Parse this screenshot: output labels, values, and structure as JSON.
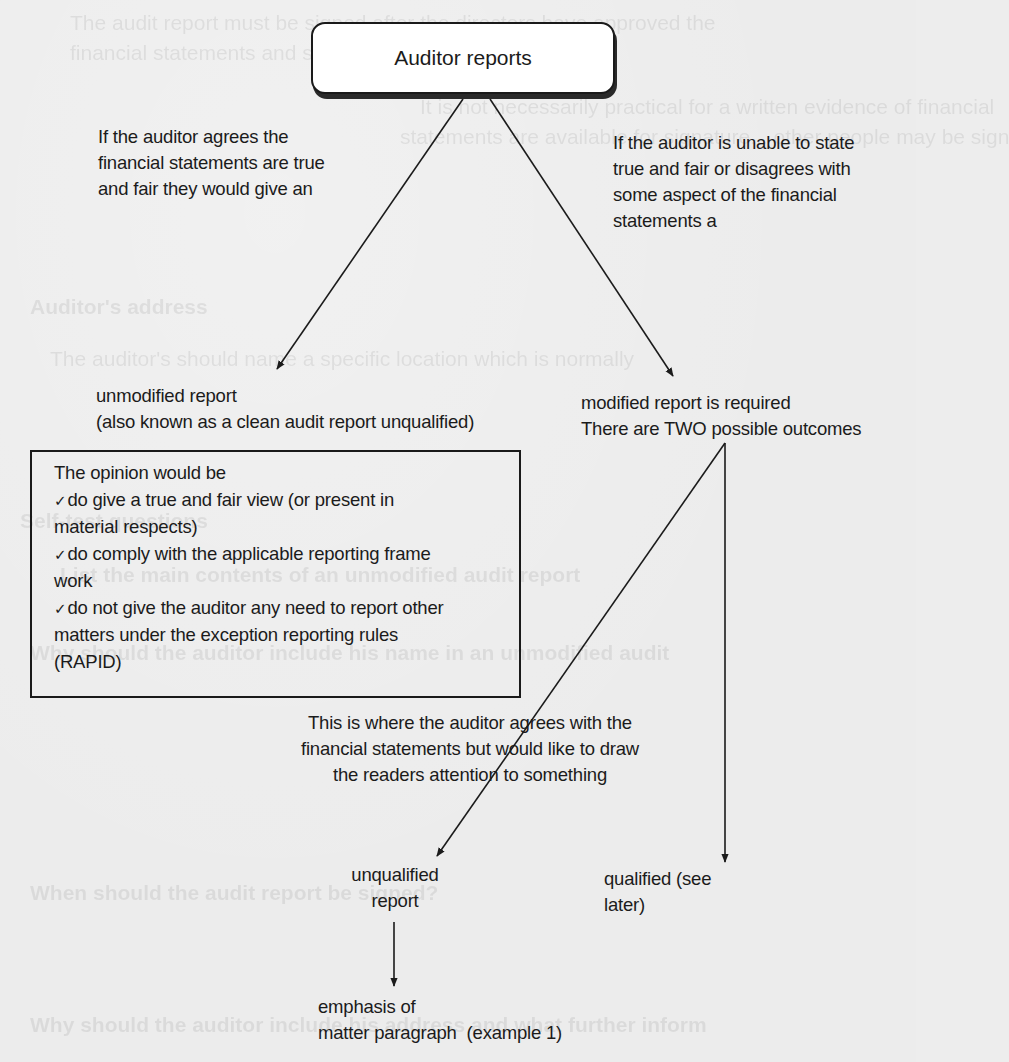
{
  "diagram": {
    "root": {
      "label": "Auditor reports"
    },
    "left_branch": {
      "condition_lines": [
        "If the auditor agrees the",
        "financial statements are true",
        "and fair they would give an"
      ],
      "result_lines": [
        "unmodified report",
        "(also known as a clean audit report unqualified)"
      ]
    },
    "right_branch": {
      "condition_lines": [
        "If the auditor is unable to state",
        "true and fair or disagrees with",
        "some aspect of the financial",
        "statements a"
      ],
      "result_lines": [
        "modified report is required",
        "There are TWO possible outcomes"
      ]
    },
    "opinion_box": {
      "heading": "The opinion would be",
      "check_glyph": "✓",
      "items": [
        {
          "lines": [
            "do give a true and fair view (or present in",
            "material respects)"
          ]
        },
        {
          "lines": [
            "do comply with the applicable reporting frame",
            "work"
          ]
        },
        {
          "lines": [
            "do not give the auditor any need to report other",
            "matters under the exception reporting rules",
            "(RAPID)"
          ]
        }
      ]
    },
    "emphasis_note": {
      "lines": [
        "This is where the auditor agrees with the",
        "financial statements but would like to draw",
        "the readers attention to something"
      ]
    },
    "outcome_unqualified": {
      "lines": [
        "unqualified",
        "report"
      ]
    },
    "outcome_qualified": {
      "lines": [
        "qualified (see",
        "later)"
      ]
    },
    "emphasis_paragraph": {
      "lines": [
        "emphasis of",
        "matter paragraph  (example 1)"
      ]
    }
  },
  "background_bleed": {
    "lines": [
      "The audit report must be signed after the directors have approved the",
      "financial statements and should be dated on the same day.",
      "It is not necessarily practical for a written evidence of financial",
      "statements are available for signature... other people may be sign",
      "Auditor's address",
      "The auditor's should name a specific location which is normally",
      "Self-test questions",
      "List the main contents of an unmodified audit report",
      "Why should the auditor include his name in an unmodified audit",
      "When should the audit report be signed?",
      "Why should the auditor include his address and what further inform"
    ]
  },
  "colors": {
    "paper": "#ececec",
    "ink": "#1b1b1b",
    "box_fill": "#ffffff"
  }
}
